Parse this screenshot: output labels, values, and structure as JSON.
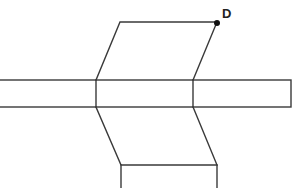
{
  "diagram": {
    "type": "net / folded strip figure",
    "colors": {
      "stroke": "#3a3a3a",
      "point": "#111111",
      "label": "#222222",
      "background": "#ffffff"
    },
    "points": [
      {
        "name": "D",
        "label": "D",
        "x": 217,
        "y": 23
      }
    ],
    "shapes": {
      "top_parallelogram": [
        [
          120,
          22
        ],
        [
          217,
          22
        ],
        [
          193,
          80
        ],
        [
          96,
          80
        ]
      ],
      "horizontal_band": {
        "x1": 0,
        "y1": 80,
        "x2": 291,
        "y2": 107,
        "dividers_x": [
          96,
          193
        ]
      },
      "bottom_parallelogram": [
        [
          96,
          107
        ],
        [
          193,
          107
        ],
        [
          217,
          165
        ],
        [
          121,
          165
        ]
      ],
      "bottom_stub": {
        "x_left": 121,
        "x_right": 217,
        "y_top": 165,
        "y_bottom": 188
      }
    }
  }
}
